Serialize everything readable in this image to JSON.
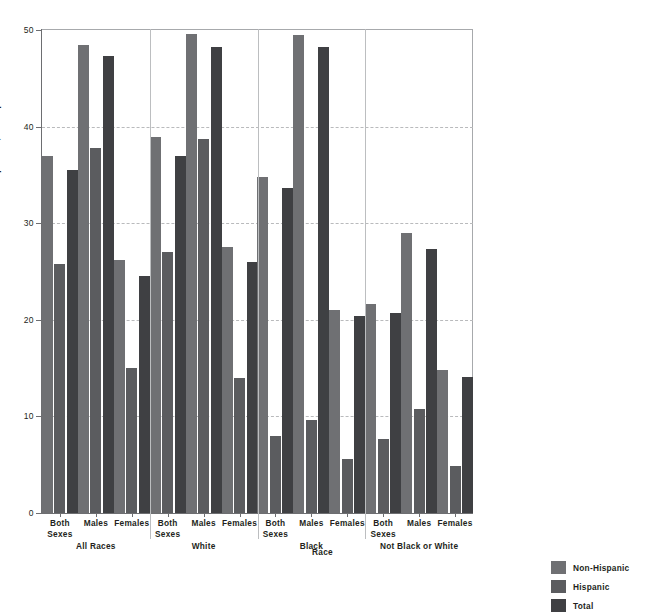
{
  "chart_data": {
    "type": "bar",
    "title": "",
    "xlabel": "Race",
    "ylabel": "Deaths per 100,000 Population",
    "ylim": [
      0,
      50
    ],
    "yticks": [
      "0",
      "10",
      "20",
      "30",
      "40",
      "50"
    ],
    "grid": true,
    "legend_position": "bottom-right",
    "categories": [
      "Both Sexes",
      "Males",
      "Females",
      "Both Sexes",
      "Males",
      "Females",
      "Both Sexes",
      "Males",
      "Females",
      "Both Sexes",
      "Males",
      "Females"
    ],
    "groups": [
      {
        "label": "All Races",
        "subgroups": [
          "Both Sexes",
          "Males",
          "Females"
        ]
      },
      {
        "label": "White",
        "subgroups": [
          "Both Sexes",
          "Males",
          "Females"
        ]
      },
      {
        "label": "Black",
        "subgroups": [
          "Both Sexes",
          "Males",
          "Females"
        ]
      },
      {
        "label": "Not Black or White",
        "subgroups": [
          "Both Sexes",
          "Males",
          "Females"
        ]
      }
    ],
    "series": [
      {
        "name": "Non-Hispanic",
        "color": "#6f7073",
        "values": [
          37.0,
          48.4,
          26.2,
          38.9,
          49.6,
          27.5,
          34.8,
          49.5,
          21.0,
          21.6,
          29.0,
          14.8
        ]
      },
      {
        "name": "Hispanic",
        "color": "#5b5c5f",
        "values": [
          25.8,
          37.8,
          15.0,
          27.0,
          38.7,
          14.0,
          8.0,
          9.6,
          5.6,
          7.7,
          10.8,
          4.9
        ]
      },
      {
        "name": "Total",
        "color": "#3f4043",
        "values": [
          35.5,
          47.3,
          24.5,
          37.0,
          48.2,
          26.0,
          33.6,
          48.2,
          20.4,
          20.7,
          27.3,
          14.1
        ]
      }
    ]
  },
  "legend": {
    "items": [
      {
        "label": "Non-Hispanic",
        "swatch": "s0"
      },
      {
        "label": "Hispanic",
        "swatch": "s1"
      },
      {
        "label": "Total",
        "swatch": "s2"
      }
    ]
  },
  "header": {
    "text": ""
  }
}
